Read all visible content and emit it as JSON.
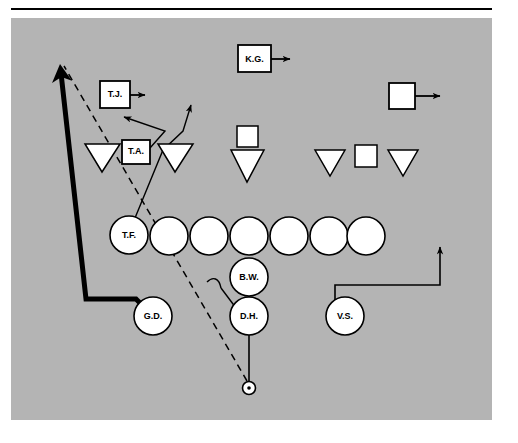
{
  "diagram": {
    "field_color": "#b4b4b4",
    "line_color": "#000000",
    "player_fill": "#ffffff"
  },
  "offense": {
    "linemen_label": "offensive-line",
    "circles": [
      {
        "id": "ol-tf",
        "label": "T.F.",
        "cx": 129,
        "cy": 235,
        "r": 19
      },
      {
        "id": "ol-2",
        "label": "",
        "cx": 169,
        "cy": 236,
        "r": 19
      },
      {
        "id": "ol-3",
        "label": "",
        "cx": 209,
        "cy": 236,
        "r": 19
      },
      {
        "id": "ol-4",
        "label": "",
        "cx": 249,
        "cy": 236,
        "r": 19
      },
      {
        "id": "ol-5",
        "label": "",
        "cx": 289,
        "cy": 236,
        "r": 19
      },
      {
        "id": "ol-6",
        "label": "",
        "cx": 329,
        "cy": 236,
        "r": 19
      },
      {
        "id": "ol-7",
        "label": "",
        "cx": 366,
        "cy": 236,
        "r": 19
      }
    ],
    "backs": [
      {
        "id": "back-gd",
        "label": "G.D.",
        "cx": 153,
        "cy": 316,
        "r": 19
      },
      {
        "id": "back-bw",
        "label": "B.W.",
        "cx": 249,
        "cy": 277,
        "r": 19
      },
      {
        "id": "back-dh",
        "label": "D.H.",
        "cx": 249,
        "cy": 316,
        "r": 19
      },
      {
        "id": "back-vs",
        "label": "V.S.",
        "cx": 345,
        "cy": 316,
        "r": 19
      }
    ],
    "ball": {
      "id": "ball-marker",
      "label": "ball-spot",
      "cx": 249,
      "cy": 388,
      "r": 6
    }
  },
  "defense": {
    "linemen_label": "defensive-line",
    "triangles": [
      {
        "id": "dl-1",
        "cx": 102,
        "cy": 158,
        "w": 35,
        "h": 28
      },
      {
        "id": "dl-2",
        "cx": 175,
        "cy": 158,
        "w": 35,
        "h": 28
      },
      {
        "id": "dl-3",
        "cx": 247,
        "cy": 156,
        "w": 33,
        "h": 28
      },
      {
        "id": "dl-4",
        "cx": 330,
        "cy": 158,
        "w": 30,
        "h": 26
      },
      {
        "id": "dl-5",
        "cx": 403,
        "cy": 158,
        "w": 30,
        "h": 26
      }
    ],
    "squares": [
      {
        "id": "lb-kg",
        "label": "K.G.",
        "x": 238,
        "y": 45,
        "w": 33,
        "h": 27,
        "arrow_to_x": 298
      },
      {
        "id": "lb-tj",
        "label": "T.J.",
        "x": 100,
        "y": 81,
        "w": 30,
        "h": 27,
        "arrow_to_x": 153
      },
      {
        "id": "lb-right",
        "label": "",
        "x": 389,
        "y": 83,
        "w": 26,
        "h": 26,
        "arrow_to_x": 448
      },
      {
        "id": "lb-mid",
        "label": "",
        "x": 237,
        "y": 126,
        "w": 21,
        "h": 21,
        "arrow_to_x": null
      },
      {
        "id": "lb-ta",
        "label": "T.A.",
        "x": 122,
        "y": 140,
        "w": 28,
        "h": 24,
        "arrow_to_x": null
      },
      {
        "id": "lb-right-inner",
        "label": "",
        "x": 355,
        "y": 145,
        "w": 22,
        "h": 22,
        "arrow_to_x": null
      }
    ]
  },
  "routes": [
    {
      "id": "route-gd-bold",
      "name": "gd-motion-bold-path",
      "style": "bold-solid",
      "desc": "from G.D. left then up with arrowhead"
    },
    {
      "id": "route-ball-dashed",
      "name": "ball-dashed-path",
      "style": "dashed",
      "desc": "from ball spot up-left past T.F. to arrow tip"
    },
    {
      "id": "route-ta-left",
      "name": "ta-blitz-left-arrow",
      "style": "thin-solid",
      "desc": "T.A. up-left arrow"
    },
    {
      "id": "route-tf-up",
      "name": "tf-release-up-right-arrow",
      "style": "thin-solid",
      "desc": "T.F. up-right arrow"
    },
    {
      "id": "route-vs",
      "name": "vs-motion-path",
      "style": "thin-solid",
      "desc": "V.S. up, right, up with arrowhead"
    },
    {
      "id": "route-dh-bw",
      "name": "dh-bw-connector",
      "style": "thin-solid",
      "desc": "D.H. to B.W. vertical connector"
    },
    {
      "id": "route-dh-hook",
      "name": "dh-hook-left",
      "style": "thin-solid",
      "desc": "D.H. to curved hook left"
    },
    {
      "id": "route-ball-dh",
      "name": "ball-to-dh-snap",
      "style": "thin-solid",
      "desc": "ball spot up to D.H."
    }
  ]
}
